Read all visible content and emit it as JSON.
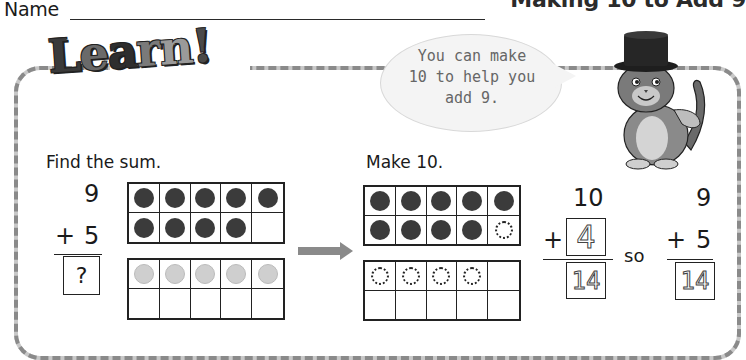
{
  "header": {
    "name_label": "Name",
    "title": "Making 10 to Add 9"
  },
  "banner": {
    "letters": [
      "L",
      "e",
      "a",
      "r",
      "n",
      "!"
    ]
  },
  "speech_bubble": {
    "lines": [
      "You can make",
      "10 to help you",
      "add 9."
    ]
  },
  "mascot": {
    "icon": "cat-with-top-hat-icon"
  },
  "left_section": {
    "instruction": "Find the sum.",
    "addend_top": "9",
    "operator": "+",
    "addend_bottom": "5",
    "answer_placeholder": "?",
    "ten_frame_top": [
      "dark",
      "dark",
      "dark",
      "dark",
      "dark",
      "dark",
      "dark",
      "dark",
      "dark",
      "empty"
    ],
    "ten_frame_bottom": [
      "light",
      "light",
      "light",
      "light",
      "light",
      "empty",
      "empty",
      "empty",
      "empty",
      "empty"
    ]
  },
  "right_section": {
    "instruction": "Make 10.",
    "ten_frame_top": [
      "dark",
      "dark",
      "dark",
      "dark",
      "dark",
      "dark",
      "dark",
      "dark",
      "dark",
      "dashed"
    ],
    "ten_frame_bottom": [
      "dashed",
      "dashed",
      "dashed",
      "dashed",
      "empty",
      "empty",
      "empty",
      "empty",
      "empty",
      "empty"
    ],
    "equation1": {
      "top": "10",
      "operator": "+",
      "addend_traced": "4",
      "sum_traced": "14"
    },
    "connector": "so",
    "equation2": {
      "top": "9",
      "operator": "+",
      "addend": "5",
      "sum_traced": "14"
    }
  },
  "colors": {
    "frame_border": "#8a8a8a",
    "counter_dark": "#3b3b3b",
    "counter_light": "#cfcfcf",
    "bubble_fill": "#f4f4f4",
    "arrow": "#8a8a8a"
  }
}
